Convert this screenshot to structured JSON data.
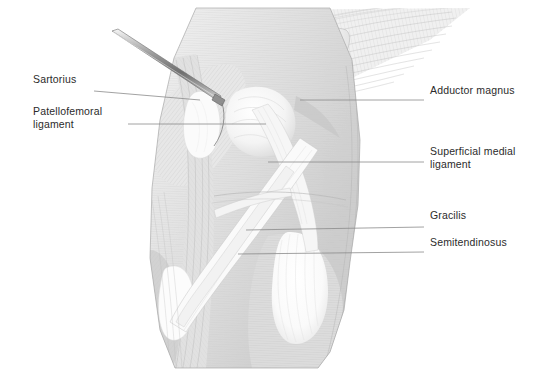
{
  "figure": {
    "style": "grayscale line-hatch medical illustration",
    "background_color": "#ffffff",
    "ink_color": "#2b2b2b",
    "leader_color": "#8a8a8a",
    "shade_light": "#f2f2f2",
    "shade_mid": "#d9d9d9",
    "shade_dark": "#b4b4b4",
    "highlight": "#ffffff"
  },
  "instrument": {
    "name": "surgical probe",
    "visible": true
  },
  "labels": [
    {
      "id": "sartorius",
      "text": "Sartorius",
      "side": "left",
      "text_x": 33,
      "text_y": 83,
      "leader": "M 94 91 L 200 100",
      "lines": [
        "Sartorius"
      ]
    },
    {
      "id": "patellofemoral-ligament",
      "text": "Patellofemoral ligament",
      "side": "left",
      "text_x": 33,
      "text_y": 115,
      "leader": "M 128 124 L 266 124",
      "lines": [
        "Patellofemoral",
        "ligament"
      ]
    },
    {
      "id": "adductor-magnus",
      "text": "Adductor magnus",
      "side": "right",
      "text_x": 430,
      "text_y": 94,
      "leader": "M 300 100 L 424 100",
      "lines": [
        "Adductor magnus"
      ]
    },
    {
      "id": "superficial-medial-ligament",
      "text": "Superficial medial ligament",
      "side": "right",
      "text_x": 430,
      "text_y": 155,
      "leader": "M 268 162 L 424 162",
      "lines": [
        "Superficial medial",
        "ligament"
      ]
    },
    {
      "id": "gracilis",
      "text": "Gracilis",
      "side": "right",
      "text_x": 430,
      "text_y": 219,
      "leader": "M 246 230 L 424 227",
      "lines": [
        "Gracilis"
      ]
    },
    {
      "id": "semitendinosus",
      "text": "Semitendinosus",
      "side": "right",
      "text_x": 430,
      "text_y": 246,
      "leader": "M 238 254 L 424 252",
      "lines": [
        "Semitendinosus"
      ]
    }
  ]
}
